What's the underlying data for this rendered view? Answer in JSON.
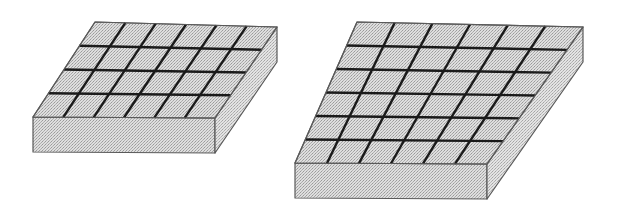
{
  "figure": {
    "title": "Two rectangular slabs with scored grid top faces",
    "background_color": "#ffffff",
    "width": 619,
    "height": 220,
    "style": {
      "face_fill": "#d9d9d9",
      "face_fill_light": "#e0e0e0",
      "face_fill_dark": "#cfcfcf",
      "stipple_dot_color": "#8c8c8c",
      "outline_color": "#5a5a5a",
      "grid_line_color": "#1a1a1a",
      "outline_width": 1.2,
      "grid_line_width": 2.4
    },
    "projection": {
      "type": "oblique",
      "description": "Top face drawn as a parallelogram; front face and right side face extruded downward."
    },
    "objects": [
      {
        "id": "slab-left",
        "label": "left-slab",
        "grid_columns": 6,
        "grid_rows": 4,
        "cell_count": 24,
        "thickness_px": 35,
        "top_face_corners": {
          "back_left": [
            95,
            22
          ],
          "back_right": [
            277,
            27
          ],
          "front_right": [
            215,
            118
          ],
          "front_left": [
            33,
            117
          ]
        }
      },
      {
        "id": "slab-right",
        "label": "right-slab",
        "grid_columns": 6,
        "grid_rows": 6,
        "cell_count": 36,
        "thickness_px": 35,
        "top_face_corners": {
          "back_left": [
            357,
            22
          ],
          "back_right": [
            583,
            27
          ],
          "front_right": [
            487,
            164
          ],
          "front_left": [
            295,
            163
          ]
        }
      }
    ]
  }
}
